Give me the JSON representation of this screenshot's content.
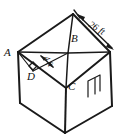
{
  "figure": {
    "kind": "geometry-diagram",
    "background_color": "#ffffff",
    "ink_color": "#1a1a1a"
  },
  "vertex_labels": [
    {
      "id": "A",
      "text": "A",
      "x": 4,
      "y": 56
    },
    {
      "id": "B",
      "text": "B",
      "x": 71,
      "y": 42
    },
    {
      "id": "C",
      "text": "C",
      "x": 68,
      "y": 90
    },
    {
      "id": "D",
      "text": "D",
      "x": 27,
      "y": 80
    }
  ],
  "dimensions": [
    {
      "id": "roof-ridge-length",
      "text": "26 ft",
      "x": 88,
      "y": 26,
      "rotation_deg": 32,
      "arrow_style": "double",
      "from_vertex": "apex",
      "to_vertex": "right-eave"
    },
    {
      "id": "rafter-height",
      "text": "4 ft",
      "x": 46,
      "y": 60,
      "rotation_deg": 62,
      "arrow_style": "double",
      "from_vertex": "D",
      "to_vertex": "B"
    }
  ],
  "markers": [
    {
      "id": "right-angle-at-D",
      "type": "right-angle-square",
      "at_vertex": "D"
    }
  ],
  "features": [
    {
      "id": "door",
      "type": "door-rectangle",
      "wall": "right-wall"
    }
  ]
}
